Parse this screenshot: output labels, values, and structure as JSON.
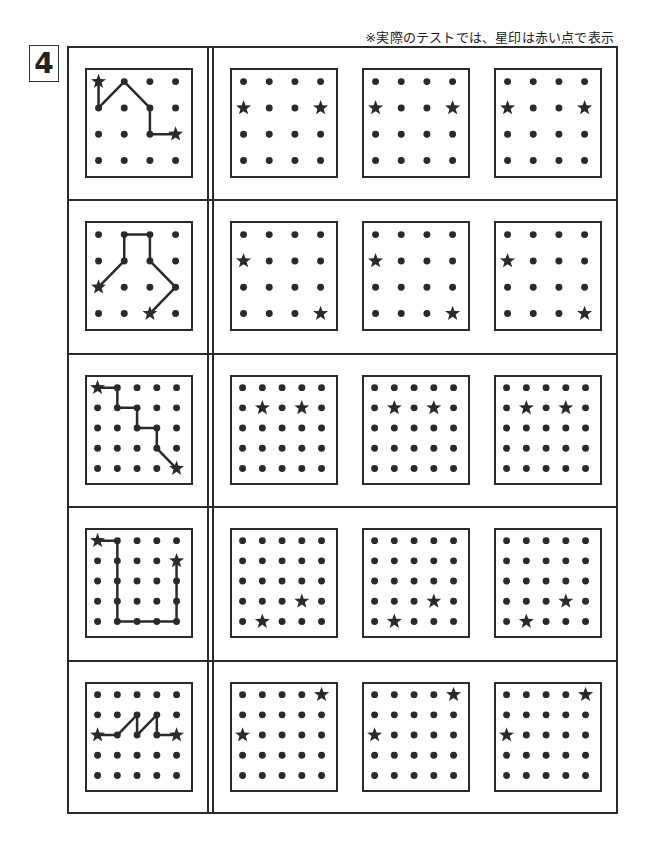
{
  "header": {
    "note": "※実際のテストでは、星印は赤い点で表示",
    "problem_number": "4"
  },
  "icons": {
    "dot": "dot-icon",
    "star": "star-icon"
  },
  "colors": {
    "ink": "#2a2a2a",
    "background": "#ffffff"
  },
  "rows": [
    {
      "grid_size": 4,
      "example": {
        "stars": [
          [
            0,
            0
          ],
          [
            3,
            2
          ]
        ],
        "path": [
          [
            0,
            0
          ],
          [
            0,
            1
          ],
          [
            1,
            0
          ],
          [
            2,
            1
          ],
          [
            2,
            2
          ],
          [
            3,
            2
          ]
        ]
      },
      "answers": [
        {
          "stars": [
            [
              0,
              1
            ],
            [
              3,
              1
            ]
          ]
        },
        {
          "stars": [
            [
              0,
              1
            ],
            [
              3,
              1
            ]
          ]
        },
        {
          "stars": [
            [
              0,
              1
            ],
            [
              3,
              1
            ]
          ]
        }
      ]
    },
    {
      "grid_size": 4,
      "example": {
        "stars": [
          [
            0,
            2
          ],
          [
            2,
            3
          ]
        ],
        "path": [
          [
            0,
            2
          ],
          [
            1,
            1
          ],
          [
            1,
            0
          ],
          [
            2,
            0
          ],
          [
            2,
            1
          ],
          [
            3,
            2
          ],
          [
            2,
            3
          ]
        ]
      },
      "answers": [
        {
          "stars": [
            [
              0,
              1
            ],
            [
              3,
              3
            ]
          ]
        },
        {
          "stars": [
            [
              0,
              1
            ],
            [
              3,
              3
            ]
          ]
        },
        {
          "stars": [
            [
              0,
              1
            ],
            [
              3,
              3
            ]
          ]
        }
      ]
    },
    {
      "grid_size": 5,
      "example": {
        "stars": [
          [
            0,
            0
          ],
          [
            4,
            4
          ]
        ],
        "path": [
          [
            0,
            0
          ],
          [
            1,
            0
          ],
          [
            1,
            1
          ],
          [
            2,
            1
          ],
          [
            2,
            2
          ],
          [
            3,
            2
          ],
          [
            3,
            3
          ],
          [
            4,
            4
          ]
        ]
      },
      "answers": [
        {
          "stars": [
            [
              1,
              1
            ],
            [
              3,
              1
            ]
          ]
        },
        {
          "stars": [
            [
              1,
              1
            ],
            [
              3,
              1
            ]
          ]
        },
        {
          "stars": [
            [
              1,
              1
            ],
            [
              3,
              1
            ]
          ]
        }
      ]
    },
    {
      "grid_size": 5,
      "example": {
        "stars": [
          [
            0,
            0
          ],
          [
            4,
            1
          ]
        ],
        "path": [
          [
            0,
            0
          ],
          [
            1,
            0
          ],
          [
            1,
            1
          ],
          [
            1,
            2
          ],
          [
            1,
            3
          ],
          [
            1,
            4
          ],
          [
            2,
            4
          ],
          [
            3,
            4
          ],
          [
            4,
            4
          ],
          [
            4,
            3
          ],
          [
            4,
            2
          ],
          [
            4,
            1
          ]
        ]
      },
      "answers": [
        {
          "stars": [
            [
              3,
              3
            ],
            [
              1,
              4
            ]
          ]
        },
        {
          "stars": [
            [
              3,
              3
            ],
            [
              1,
              4
            ]
          ]
        },
        {
          "stars": [
            [
              3,
              3
            ],
            [
              1,
              4
            ]
          ]
        }
      ]
    },
    {
      "grid_size": 5,
      "example": {
        "stars": [
          [
            0,
            2
          ],
          [
            4,
            2
          ]
        ],
        "path": [
          [
            0,
            2
          ],
          [
            1,
            2
          ],
          [
            2,
            1
          ],
          [
            2,
            2
          ],
          [
            3,
            1
          ],
          [
            3,
            2
          ],
          [
            4,
            2
          ]
        ]
      },
      "answers": [
        {
          "stars": [
            [
              4,
              0
            ],
            [
              0,
              2
            ]
          ]
        },
        {
          "stars": [
            [
              4,
              0
            ],
            [
              0,
              2
            ]
          ]
        },
        {
          "stars": [
            [
              4,
              0
            ],
            [
              0,
              2
            ]
          ]
        }
      ]
    }
  ]
}
